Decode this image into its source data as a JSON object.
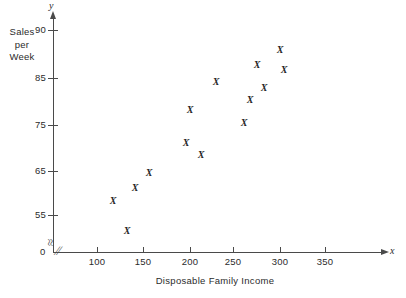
{
  "chart_data": {
    "type": "scatter",
    "title": "",
    "xlabel": "Disposable Family Income",
    "ylabel": "Sales per Week",
    "ylabel_lines": [
      "Sales",
      "per",
      "Week"
    ],
    "x_axis_letter": "x",
    "y_axis_letter": "y",
    "origin_label": "0",
    "xlim": [
      75,
      380
    ],
    "ylim": [
      50,
      92
    ],
    "xticks": [
      100,
      150,
      200,
      250,
      300,
      350
    ],
    "xtick_labels": [
      "100",
      "150",
      "200",
      "250",
      "300",
      "350"
    ],
    "yticks": [
      55,
      65,
      75,
      85,
      90
    ],
    "ytick_labels": [
      "55",
      "65",
      "75",
      "85",
      "90"
    ],
    "grid": false,
    "legend": null,
    "axis_break_x": true,
    "axis_break_y": true,
    "marker": "X",
    "marker_color": "#262626",
    "axis_color": "#4a4a4a",
    "points": [
      {
        "x": 117,
        "y": 57.5,
        "px": 113,
        "py": 201
      },
      {
        "x": 132,
        "y": 51.0,
        "px": 127,
        "py": 231
      },
      {
        "x": 141,
        "y": 60.5,
        "px": 135,
        "py": 188
      },
      {
        "x": 156,
        "y": 64.0,
        "px": 149,
        "py": 173
      },
      {
        "x": 196,
        "y": 70.5,
        "px": 186,
        "py": 143
      },
      {
        "x": 200,
        "y": 77.5,
        "px": 190,
        "py": 110
      },
      {
        "x": 212,
        "y": 67.0,
        "px": 201,
        "py": 155
      },
      {
        "x": 228,
        "y": 83.5,
        "px": 216,
        "py": 82
      },
      {
        "x": 258,
        "y": 75.0,
        "px": 244,
        "py": 123
      },
      {
        "x": 264,
        "y": 80.0,
        "px": 250,
        "py": 100
      },
      {
        "x": 272,
        "y": 86.0,
        "px": 257,
        "py": 65
      },
      {
        "x": 280,
        "y": 82.0,
        "px": 264,
        "py": 88
      },
      {
        "x": 296,
        "y": 88.0,
        "px": 280,
        "py": 50
      },
      {
        "x": 300,
        "y": 85.5,
        "px": 284,
        "py": 70
      }
    ]
  },
  "axes": {
    "y_ticks": [
      {
        "label": "90",
        "py": 30
      },
      {
        "label": "85",
        "py": 78
      },
      {
        "label": "75",
        "py": 125
      },
      {
        "label": "65",
        "py": 171
      },
      {
        "label": "55",
        "py": 215
      }
    ],
    "x_ticks": [
      {
        "label": "100",
        "px": 97
      },
      {
        "label": "150",
        "px": 143
      },
      {
        "label": "200",
        "px": 190
      },
      {
        "label": "250",
        "px": 233
      },
      {
        "label": "300",
        "px": 280
      },
      {
        "label": "350",
        "px": 325
      }
    ]
  },
  "symbols": {
    "y_break": "≈",
    "x_break": "∕∕"
  }
}
